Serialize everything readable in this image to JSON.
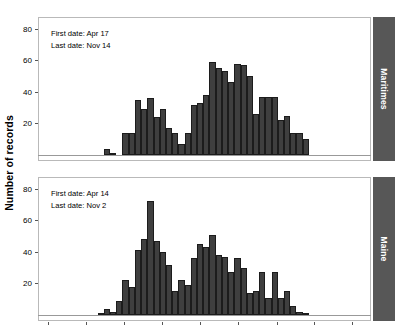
{
  "figure": {
    "ylabel": "Number of records",
    "background": "#ffffff",
    "bar_color": "#3f3f3f",
    "strip_color": "#575757",
    "panel_border": "#b9b9b9"
  },
  "chart_data": {
    "type": "bar",
    "title": "",
    "xlabel": "",
    "ylabel": "Number of records",
    "ylim": [
      0,
      85
    ],
    "yticks": [
      20,
      40,
      60,
      80
    ],
    "xticks": [
      "Mar",
      "Apr",
      "May",
      "Jun",
      "Jul",
      "Aug",
      "Sep",
      "Oct",
      "Nov"
    ],
    "xtick_days": [
      60,
      91,
      121,
      152,
      182,
      213,
      244,
      274,
      305
    ],
    "xlim_days": [
      52,
      320
    ],
    "grid": false,
    "legend": "none",
    "bin_width_days": 5,
    "panels": [
      {
        "name": "Maritimes",
        "strip_label": "Maritimes",
        "annotations": [
          "First date: Apr 17",
          "Last date: Nov 14"
        ],
        "first_date": "Apr 17",
        "last_date": "Nov 14",
        "bin_starts": [
          105,
          110,
          115,
          120,
          125,
          130,
          135,
          140,
          145,
          150,
          155,
          160,
          165,
          170,
          175,
          180,
          185,
          190,
          195,
          200,
          205,
          210,
          215,
          220,
          225,
          230,
          235,
          240,
          245,
          250,
          255,
          260,
          265,
          270,
          275,
          280,
          285,
          290,
          295,
          300,
          305,
          310,
          315
        ],
        "values": [
          4,
          1,
          0,
          14,
          14,
          35,
          29,
          36,
          24,
          29,
          17,
          14,
          7,
          14,
          32,
          33,
          38,
          59,
          55,
          53,
          46,
          58,
          57,
          50,
          26,
          37,
          37,
          37,
          22,
          25,
          14,
          14,
          10,
          0,
          0,
          0,
          0,
          0,
          0,
          0,
          0,
          0,
          0
        ]
      },
      {
        "name": "Maine",
        "strip_label": "Maine",
        "annotations": [
          "First date: Apr 14",
          "Last date: Nov 2"
        ],
        "first_date": "Apr 14",
        "last_date": "Nov 2",
        "bin_starts": [
          100,
          105,
          110,
          115,
          120,
          125,
          130,
          135,
          140,
          145,
          150,
          155,
          160,
          165,
          170,
          175,
          180,
          185,
          190,
          195,
          200,
          205,
          210,
          215,
          220,
          225,
          230,
          235,
          240,
          245,
          250,
          255,
          260,
          265,
          270,
          275,
          280,
          285,
          290,
          295,
          300,
          305
        ],
        "values": [
          1,
          4,
          2,
          9,
          22,
          18,
          41,
          48,
          72,
          47,
          40,
          32,
          15,
          22,
          19,
          36,
          45,
          43,
          51,
          38,
          37,
          27,
          36,
          30,
          14,
          15,
          27,
          11,
          27,
          11,
          15,
          6,
          2,
          1,
          0,
          0,
          0,
          0,
          0,
          0,
          0,
          0
        ]
      }
    ]
  }
}
